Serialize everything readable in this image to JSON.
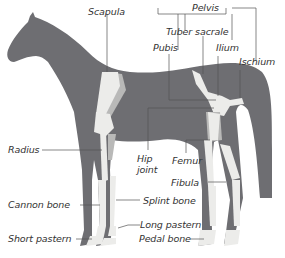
{
  "diagram": {
    "colors": {
      "body": "#6e6e72",
      "bone": "#ececea",
      "bone_shadow": "#b9b9b8",
      "leader_line": "#555555",
      "label_text": "#333333",
      "background": "#ffffff"
    },
    "labels": {
      "scapula": "Scapula",
      "pelvis": "Pelvis",
      "tuber_sacrale": "Tuber sacrale",
      "pubis": "Pubis",
      "ilium": "Ilium",
      "ischium": "Ischium",
      "radius": "Radius",
      "hip_joint_line1": "Hip",
      "hip_joint_line2": "joint",
      "femur": "Femur",
      "fibula": "Fibula",
      "cannon_bone": "Cannon bone",
      "splint_bone": "Splint bone",
      "long_pastern": "Long pastern",
      "short_pastern": "Short pastern",
      "pedal_bone": "Pedal bone"
    }
  }
}
